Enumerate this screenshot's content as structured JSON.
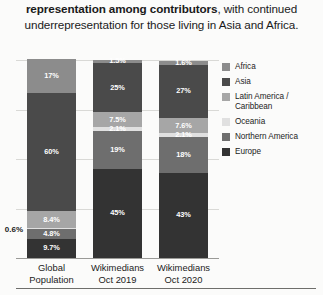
{
  "caption": {
    "bold_text": "representation among contributors",
    "rest_text": ", with continued underrepresentation for those living in Asia and Africa."
  },
  "legend": {
    "position": "right",
    "items": [
      {
        "label": "Africa",
        "color": "#8c8c8c"
      },
      {
        "label": "Asia",
        "color": "#4a4a4a"
      },
      {
        "label": "Latin America / Caribbean",
        "color": "#a6a6a6"
      },
      {
        "label": "Oceania",
        "color": "#e0e0e0"
      },
      {
        "label": "Northern America",
        "color": "#6e6e6e"
      },
      {
        "label": "Europe",
        "color": "#333333"
      }
    ]
  },
  "chart_data": {
    "type": "bar",
    "subtype": "stacked-100-percent",
    "title": "",
    "xlabel": "",
    "ylabel": "",
    "ylim": [
      0,
      100
    ],
    "grid": true,
    "categories": [
      "Global Population",
      "Wikimedians Oct 2019",
      "Wikimedians Oct 2020"
    ],
    "category_labels": [
      [
        "Global",
        "Population"
      ],
      [
        "Wikimedians",
        "Oct 2019"
      ],
      [
        "Wikimedians",
        "Oct 2020"
      ]
    ],
    "series": [
      {
        "name": "Europe",
        "color": "#333333",
        "values": [
          9.7,
          45,
          43
        ],
        "labels": [
          "9.7%",
          "45%",
          "43%"
        ]
      },
      {
        "name": "Northern America",
        "color": "#6e6e6e",
        "values": [
          4.8,
          19,
          18
        ],
        "labels": [
          "4.8%",
          "19%",
          "18%"
        ]
      },
      {
        "name": "Oceania",
        "color": "#e0e0e0",
        "values": [
          0.6,
          2.1,
          2.1
        ],
        "labels": [
          "0.6%",
          "2.1%",
          "2.1%"
        ],
        "label_outside": [
          true,
          false,
          false
        ]
      },
      {
        "name": "Latin America / Caribbean",
        "color": "#a6a6a6",
        "values": [
          8.4,
          7.5,
          7.6
        ],
        "labels": [
          "8.4%",
          "7.5%",
          "7.6%"
        ]
      },
      {
        "name": "Asia",
        "color": "#4a4a4a",
        "values": [
          60,
          25,
          27
        ],
        "labels": [
          "60%",
          "25%",
          "27%"
        ]
      },
      {
        "name": "Africa",
        "color": "#8c8c8c",
        "values": [
          17,
          1.5,
          1.6
        ],
        "labels": [
          "17%",
          "1.5%",
          "1.6%"
        ]
      }
    ],
    "gridline_values": [
      100,
      75,
      50,
      25,
      0
    ]
  }
}
